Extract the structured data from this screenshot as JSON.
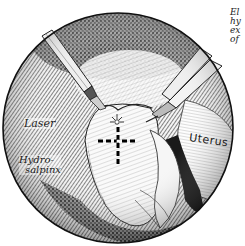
{
  "illustration": {
    "subject": "laparoscopic view of hydrosalpinx with laser",
    "labels": {
      "laser": "Laser",
      "hydrosalpinx_line1": "Hydro-",
      "hydrosalpinx_line2": "salpinx",
      "uterus": "Uterus"
    },
    "caption_fragments": [
      "El",
      "hy",
      "ex",
      "of"
    ],
    "colors": {
      "ink": "#1a1a1a",
      "paper": "#ffffff",
      "shade": "#555555"
    }
  }
}
